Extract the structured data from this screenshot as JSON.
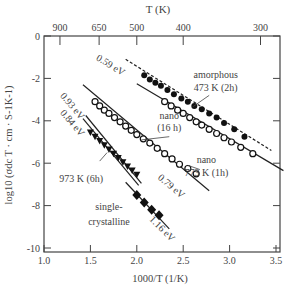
{
  "chart_data": {
    "type": "scatter",
    "title": "",
    "xlabel": "1000/T (1/K)",
    "ylabel": "log10 (σdc T · cm · S⁻¹K⁻¹)",
    "top_xlabel": "T (K)",
    "xlim": [
      1.0,
      3.5
    ],
    "ylim": [
      -10,
      0
    ],
    "x_ticks": [
      "1.0",
      "1.5",
      "2.0",
      "2.5",
      "3.0",
      "3.5"
    ],
    "y_ticks": [
      "0",
      "-2",
      "-4",
      "-6",
      "-8",
      "-10"
    ],
    "top_ticks": [
      {
        "label": "900",
        "x": 1.172
      },
      {
        "label": "650",
        "x": 1.594
      },
      {
        "label": "500",
        "x": 2.0
      },
      {
        "label": "400",
        "x": 2.5
      },
      {
        "label": "300",
        "x": 3.333
      }
    ],
    "grid": false,
    "series": [
      {
        "name": "amorphous 473 K (2h)",
        "marker": "filled-circle",
        "activation_energy": "0.59 eV",
        "points": [
          [
            2.08,
            -1.85
          ],
          [
            2.14,
            -2.05
          ],
          [
            2.2,
            -2.2
          ],
          [
            2.26,
            -2.35
          ],
          [
            2.33,
            -2.55
          ],
          [
            2.4,
            -2.75
          ],
          [
            2.48,
            -2.95
          ],
          [
            2.55,
            -3.1
          ],
          [
            2.62,
            -3.3
          ],
          [
            2.7,
            -3.45
          ],
          [
            2.78,
            -3.65
          ],
          [
            2.86,
            -3.85
          ],
          [
            2.94,
            -4.1
          ],
          [
            3.05,
            -4.4
          ],
          [
            3.16,
            -4.75
          ]
        ],
        "fit_line": [
          [
            1.88,
            -1.1
          ],
          [
            3.45,
            -5.4
          ]
        ],
        "fit_dashed": true
      },
      {
        "name": "nano (16 h)",
        "marker": "open-circle",
        "activation_energy": "",
        "points": [
          [
            2.3,
            -3.1
          ],
          [
            2.37,
            -3.3
          ],
          [
            2.44,
            -3.5
          ],
          [
            2.5,
            -3.65
          ],
          [
            2.57,
            -3.85
          ],
          [
            2.64,
            -4.05
          ],
          [
            2.7,
            -4.2
          ],
          [
            2.78,
            -4.4
          ],
          [
            2.86,
            -4.6
          ],
          [
            2.94,
            -4.8
          ],
          [
            3.02,
            -5.0
          ],
          [
            3.12,
            -5.25
          ],
          [
            3.25,
            -5.55
          ]
        ],
        "fit_line": [
          [
            2.0,
            -2.25
          ],
          [
            3.58,
            -6.35
          ]
        ]
      },
      {
        "name": "nano 773 K (1h)",
        "marker": "open-circle",
        "activation_energy": "0.79 eV",
        "points": [
          [
            1.55,
            -3.1
          ],
          [
            1.6,
            -3.3
          ],
          [
            1.65,
            -3.5
          ],
          [
            1.7,
            -3.65
          ],
          [
            1.76,
            -3.85
          ],
          [
            1.82,
            -4.05
          ],
          [
            1.88,
            -4.25
          ],
          [
            1.94,
            -4.45
          ],
          [
            2.0,
            -4.65
          ],
          [
            2.07,
            -4.85
          ],
          [
            2.14,
            -5.05
          ],
          [
            2.22,
            -5.3
          ],
          [
            2.3,
            -5.55
          ],
          [
            2.38,
            -5.8
          ],
          [
            2.46,
            -6.05
          ],
          [
            2.55,
            -6.25
          ],
          [
            2.64,
            -6.5
          ]
        ],
        "fit_line": [
          [
            1.42,
            -2.3
          ],
          [
            2.78,
            -7.3
          ]
        ]
      },
      {
        "name": "973 K (6h)",
        "marker": "filled-triangle",
        "activation_energy": "0.84 eV",
        "points": [
          [
            1.5,
            -4.55
          ],
          [
            1.55,
            -4.75
          ],
          [
            1.6,
            -4.95
          ],
          [
            1.65,
            -5.15
          ],
          [
            1.7,
            -5.35
          ],
          [
            1.75,
            -5.55
          ],
          [
            1.8,
            -5.75
          ],
          [
            1.85,
            -5.95
          ],
          [
            1.9,
            -6.15
          ],
          [
            1.95,
            -6.35
          ],
          [
            2.0,
            -6.55
          ]
        ],
        "fit_line": [
          [
            1.42,
            -3.9
          ],
          [
            2.02,
            -7.05
          ]
        ]
      },
      {
        "name": "973 K (6h) (0.93 eV fit)",
        "marker": "none",
        "activation_energy": "0.93 eV",
        "points": [],
        "fit_line": [
          [
            1.45,
            -3.75
          ],
          [
            2.05,
            -6.95
          ]
        ]
      },
      {
        "name": "single-crystalline",
        "marker": "filled-diamond",
        "activation_energy": "1.16 eV",
        "points": [
          [
            2.0,
            -7.5
          ],
          [
            2.08,
            -7.85
          ],
          [
            2.16,
            -8.2
          ],
          [
            2.24,
            -8.45
          ]
        ],
        "fit_line": [
          [
            1.88,
            -6.9
          ],
          [
            2.35,
            -9.1
          ]
        ]
      }
    ],
    "annotations": [
      {
        "text": "0.59 eV",
        "x": 1.7,
        "y": -1.5,
        "rotation": 32
      },
      {
        "text": "amorphous",
        "x": 2.85,
        "y": -2.0
      },
      {
        "text": "473 K (2h)",
        "x": 2.85,
        "y": -2.6
      },
      {
        "text": "nano",
        "x": 2.35,
        "y": -3.9
      },
      {
        "text": "(16 h)",
        "x": 2.35,
        "y": -4.5
      },
      {
        "text": "nano",
        "x": 2.75,
        "y": -6.0
      },
      {
        "text": "773 K (1h)",
        "x": 2.75,
        "y": -6.6
      },
      {
        "text": "0.79 eV",
        "x": 2.35,
        "y": -7.2,
        "rotation": 40
      },
      {
        "text": "0.93 eV",
        "x": 1.28,
        "y": -3.4,
        "rotation": 50
      },
      {
        "text": "0.84 eV",
        "x": 1.28,
        "y": -4.2,
        "rotation": 50
      },
      {
        "text": "973 K (6h)",
        "x": 1.4,
        "y": -6.9
      },
      {
        "text": "single-",
        "x": 1.7,
        "y": -8.2
      },
      {
        "text": "crystalline",
        "x": 1.7,
        "y": -8.9
      },
      {
        "text": "1.16 eV",
        "x": 2.25,
        "y": -9.2,
        "rotation": 45
      }
    ]
  },
  "labels": {
    "top_axis_title": "T (K)",
    "bottom_axis_title": "1000/T (1/K)",
    "y_axis_title": "log10 (σdc T · cm · S-1K-1)"
  }
}
